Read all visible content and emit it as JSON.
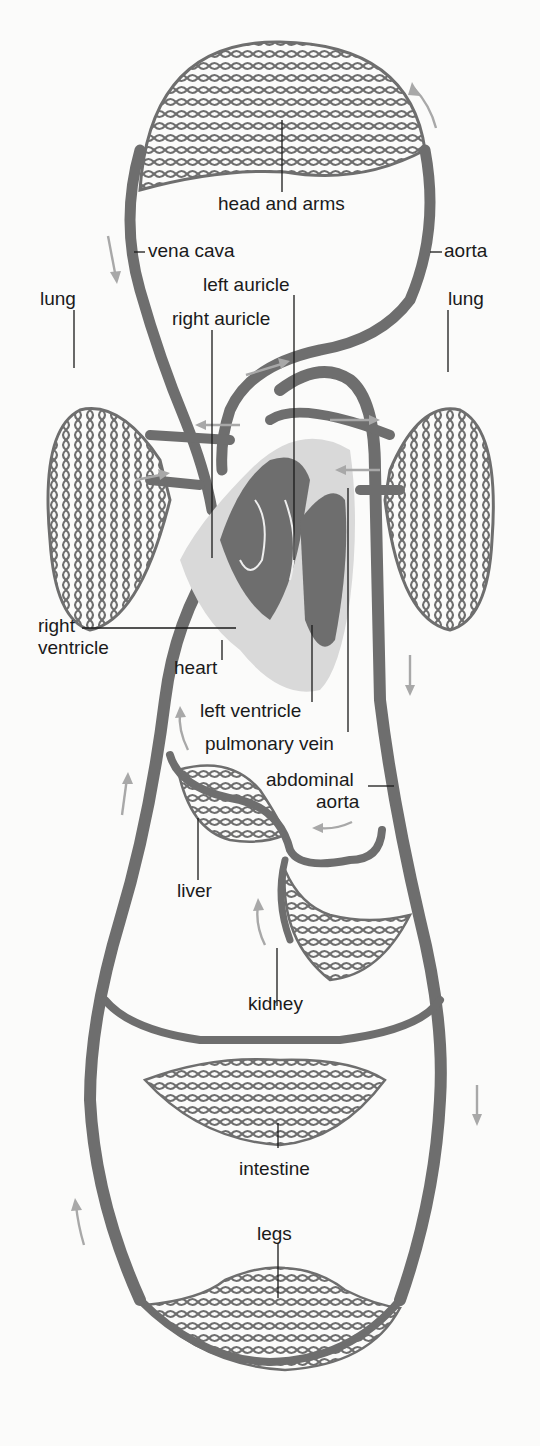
{
  "diagram": {
    "type": "circulatory-system",
    "colors": {
      "vessel": "#6e6e6e",
      "heart_light": "#d9d9d9",
      "label": "#1a1a1a",
      "arrow": "#a8a8a8",
      "background": "#fbfbfa"
    },
    "labels": {
      "head_and_arms": "head and arms",
      "vena_cava": "vena cava",
      "aorta": "aorta",
      "left_auricle": "left auricle",
      "right_auricle": "right auricle",
      "lung_left": "lung",
      "lung_right": "lung",
      "right_ventricle_1": "right",
      "right_ventricle_2": "ventricle",
      "heart": "heart",
      "left_ventricle": "left ventricle",
      "pulmonary_vein": "pulmonary vein",
      "abdominal_aorta_1": "abdominal",
      "abdominal_aorta_2": "aorta",
      "liver": "liver",
      "kidney": "kidney",
      "intestine": "intestine",
      "legs": "legs"
    }
  }
}
